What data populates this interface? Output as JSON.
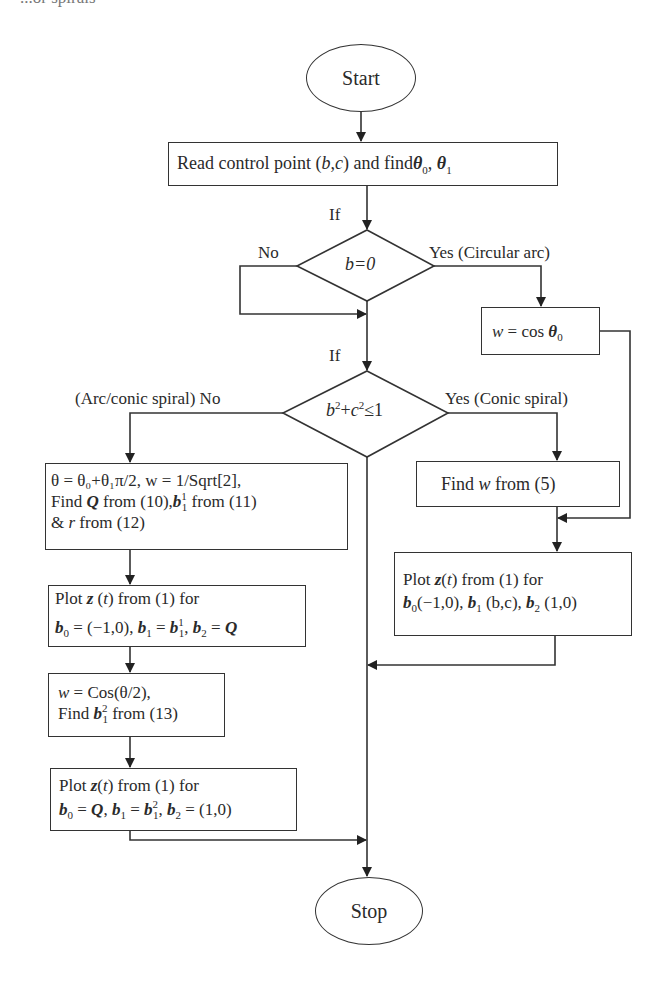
{
  "page": {
    "top_cut_text": "...or spirals"
  },
  "flowchart": {
    "start": {
      "label": "Start"
    },
    "read": {
      "prefix": "Read control point (",
      "b": "b",
      "comma": ",",
      "c": "c",
      "mid": ") and find",
      "theta0": "θ",
      "theta0_sub": "0",
      "sep": ", ",
      "theta1": "θ",
      "theta1_sub": "1"
    },
    "decision1": {
      "if_label": "If",
      "condition": "b=0",
      "no_label": "No",
      "yes_label": "Yes  (Circular arc)"
    },
    "circular": {
      "w": "w",
      "eq": " = cos  ",
      "theta": "θ",
      "sub": "0"
    },
    "decision2": {
      "if_label": "If",
      "cond_b": "b",
      "cond_plus": "+",
      "cond_c": "c",
      "sup": "2",
      "cond_le": "≤1",
      "no_label": "(Arc/conic spiral)  No",
      "yes_label": "Yes  (Conic spiral)"
    },
    "find_w": {
      "prefix": "Find ",
      "w": "w",
      "suffix": " from (5)"
    },
    "plot_conic": {
      "line1_a": "Plot ",
      "z": "z",
      "line1_b": "(",
      "t": "t",
      "line1_c": ") from (1) for",
      "b": "b",
      "s0": "0",
      "v0": "(−1,0), ",
      "s1": "1",
      "v1": " (b,c), ",
      "s2": "2",
      "v2": " (1,0)"
    },
    "arc_setup": {
      "line1": "θ = θ₀+θ₁π/2, w = 1/Sqrt[2],",
      "line2_a": "Find ",
      "Q": "Q",
      "line2_b": " from (10),",
      "b": "b",
      "sup1": "1",
      "sub1": "1",
      "line2_c": " from (11)",
      "line3_a": " & ",
      "r": "r",
      "line3_b": " from (12)"
    },
    "plot_arc1": {
      "line1_a": "Plot ",
      "z": "z",
      "line1_b": " (",
      "t": "t",
      "line1_c": ") from (1) for",
      "b": "b",
      "s0": "0",
      "v0": " = (−1,0), ",
      "s1": "1",
      "v1a": " = ",
      "v1b_sup": "1",
      "v1b_sub": "1",
      "v1c": ", ",
      "s2": "2",
      "v2": " = ",
      "Q": "Q"
    },
    "arc_w2": {
      "w": "w",
      "line1": " = Cos(θ/2),",
      "line2_a": "Find ",
      "b": "b",
      "sup": "2",
      "sub": "1",
      "line2_b": " from (13)"
    },
    "plot_arc2": {
      "line1_a": "Plot ",
      "z": "z",
      "line1_b": "(",
      "t": "t",
      "line1_c": ") from (1) for",
      "b": "b",
      "s0": "0",
      "eq": " = ",
      "Q": "Q",
      "s1": "1",
      "sup": "2",
      "sub": "1",
      "s2": "2",
      "v2": " = (1,0)",
      "comma": ", "
    },
    "stop": {
      "label": "Stop"
    }
  },
  "colors": {
    "line": "#333333",
    "text": "#2a2a2a",
    "background": "#ffffff"
  }
}
